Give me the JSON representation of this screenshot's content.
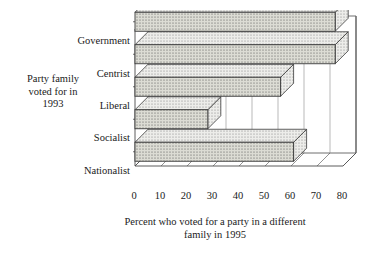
{
  "chart_data": {
    "type": "bar",
    "orientation": "horizontal",
    "style": "3d-extruded",
    "title": "",
    "xlabel": "Percent who voted for a party in a different family in 1995",
    "xlabel_lines": [
      "Percent who voted for a party in a different",
      "family in 1995"
    ],
    "ylabel": "Party family voted for in 1993",
    "ylabel_lines": [
      "Party family",
      "voted for in",
      "1993"
    ],
    "categories": [
      "Nationalist",
      "Socialist",
      "Liberal",
      "Centrist",
      "Government"
    ],
    "values": [
      61,
      28,
      56,
      77,
      77
    ],
    "xlim": [
      0,
      80
    ],
    "xticks": [
      0,
      10,
      20,
      30,
      40,
      50,
      60,
      70,
      80
    ],
    "xtick_labels": [
      "0",
      "10",
      "20",
      "30",
      "40",
      "50",
      "60",
      "70",
      "80"
    ],
    "grid": true,
    "grid_axis": "x",
    "legend": false,
    "bar_fill": "#dcdcd4",
    "bar_edge": "#3a3a3a",
    "axis_color": "#4a4a4a",
    "grid_color": "#8a8a8a"
  }
}
